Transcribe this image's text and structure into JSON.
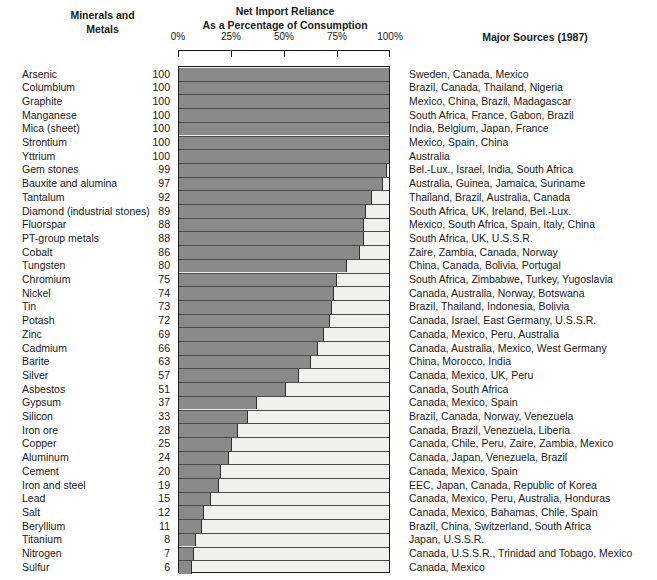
{
  "header": {
    "left_line1": "Minerals and",
    "left_line2": "Metals",
    "center_line1": "Net Import Reliance",
    "center_line2": "As a Percentage of Consumption",
    "right": "Major Sources (1987)"
  },
  "chart_data": {
    "type": "bar",
    "orientation": "horizontal",
    "title": "Net Import Reliance As a Percentage of Consumption",
    "xlabel": "",
    "ylabel": "Minerals and Metals",
    "xlim": [
      0,
      100
    ],
    "grid": false,
    "legend": "none",
    "tick_labels": [
      "0%",
      "25%",
      "50%",
      "75%",
      "100%"
    ],
    "tick_values": [
      0,
      25,
      50,
      75,
      100
    ],
    "bar_color": "#8a8a8a",
    "track_color": "#f0f0ee",
    "categories": [
      "Arsenic",
      "Columbium",
      "Graphite",
      "Manganese",
      "Mica (sheet)",
      "Strontium",
      "Yttrium",
      "Gem stones",
      "Bauxite and alumina",
      "Tantalum",
      "Diamond (industrial stones)",
      "Fluorspar",
      "PT-group metals",
      "Cobalt",
      "Tungsten",
      "Chromium",
      "Nickel",
      "Tin",
      "Potash",
      "Zinc",
      "Cadmium",
      "Barite",
      "Silver",
      "Asbestos",
      "Gypsum",
      "Silicon",
      "Iron ore",
      "Copper",
      "Aluminum",
      "Cement",
      "Iron and steel",
      "Lead",
      "Salt",
      "Beryllium",
      "Titanium",
      "Nitrogen",
      "Sulfur"
    ],
    "values": [
      100,
      100,
      100,
      100,
      100,
      100,
      100,
      99,
      97,
      92,
      89,
      88,
      88,
      86,
      80,
      75,
      74,
      73,
      72,
      69,
      66,
      63,
      57,
      51,
      37,
      33,
      28,
      25,
      24,
      20,
      19,
      15,
      12,
      11,
      8,
      7,
      6
    ],
    "sources": [
      "Sweden, Canada, Mexico",
      "Brazil, Canada, Thailand, Nigeria",
      "Mexico, China, Brazil, Madagascar",
      "South Africa, France, Gabon, Brazil",
      "India, Belgium, Japan, France",
      "Mexico, Spain, China",
      "Australia",
      "Bel.-Lux., Israel, India, South Africa",
      "Australia, Guinea, Jamaica, Suriname",
      "Thailand, Brazil, Australia, Canada",
      "South Africa, UK, Ireland, Bel.-Lux.",
      "Mexico, South Africa, Spain, Italy, China",
      "South Africa, UK, U.S.S.R.",
      "Zaire, Zambia, Canada, Norway",
      "China, Canada, Bolivia, Portugal",
      "South Africa, Zimbabwe, Turkey, Yugoslavia",
      "Canada, Australia, Norway, Botswana",
      "Brazil, Thailand, Indonesia, Bolivia",
      "Canada, Israel, East Germany, U.S.S.R.",
      "Canada, Mexico, Peru, Australia",
      "Canada, Australia, Mexico, West Germany",
      "China, Morocco, India",
      "Canada, Mexico, UK, Peru",
      "Canada, South Africa",
      "Canada, Mexico, Spain",
      "Brazil, Canada, Norway, Venezuela",
      "Canada, Brazil, Venezuela, Liberia",
      "Canada, Chile, Peru, Zaire, Zambia, Mexico",
      "Canada, Japan, Venezuela, Brazil",
      "Canada, Mexico, Spain",
      "EEC, Japan, Canada, Republic of Korea",
      "Canada, Mexico, Peru, Australia, Honduras",
      "Canada, Mexico, Bahamas, Chile, Spain",
      "Brazil, China, Switzerland, South Africa",
      "Japan, U.S.S.R.",
      "Canada, U.S.S.R., Trinidad and Tobago, Mexico",
      "Canada, Mexico"
    ]
  }
}
